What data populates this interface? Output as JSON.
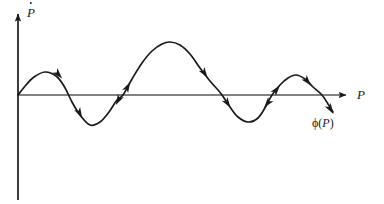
{
  "figure": {
    "name": "phase-portrait-pdot-vs-p",
    "background_color": "#ffffff",
    "stroke_color": "#1a1a1a"
  },
  "axes": {
    "y_axis": {
      "label": "P",
      "label_accent": "dot",
      "label_full": "Ṗ",
      "name": "y-axis",
      "origin_x": 18,
      "top_y": 12,
      "bottom_y": 200,
      "arrow": "up"
    },
    "x_axis": {
      "label": "P",
      "name": "x-axis",
      "origin_y": 95,
      "left_x": 18,
      "right_x": 350,
      "arrow": "right"
    }
  },
  "annotations": {
    "curve_label": "ϕ(P)",
    "curve_label_phi": "ϕ",
    "curve_label_paren_open": "(",
    "curve_label_var": "P",
    "curve_label_paren_close": ")"
  },
  "chart_data": {
    "type": "line",
    "title": "",
    "xlabel": "P",
    "ylabel": "P-dot",
    "legend": [],
    "grid": false,
    "axis_origin": [
      18,
      95
    ],
    "xlim": [
      18,
      350
    ],
    "ylim": [
      200,
      12
    ],
    "series": [
      {
        "name": "phi(P)",
        "description": "Oscillating curve through origin: small peak, trough, large peak, deep trough, medium peak, descending past axis",
        "points": [
          [
            18,
            95
          ],
          [
            26,
            85
          ],
          [
            34,
            77
          ],
          [
            45,
            72
          ],
          [
            56,
            76
          ],
          [
            64,
            86
          ],
          [
            72,
            102
          ],
          [
            80,
            115
          ],
          [
            90,
            125
          ],
          [
            100,
            122
          ],
          [
            109,
            112
          ],
          [
            117,
            100
          ],
          [
            123,
            95
          ],
          [
            132,
            79
          ],
          [
            142,
            63
          ],
          [
            152,
            51
          ],
          [
            162,
            44
          ],
          [
            170,
            42
          ],
          [
            180,
            45
          ],
          [
            190,
            54
          ],
          [
            200,
            68
          ],
          [
            210,
            81
          ],
          [
            218,
            90
          ],
          [
            222,
            95
          ],
          [
            230,
            107
          ],
          [
            238,
            117
          ],
          [
            248,
            122
          ],
          [
            258,
            118
          ],
          [
            266,
            106
          ],
          [
            272,
            95
          ],
          [
            280,
            85
          ],
          [
            288,
            78
          ],
          [
            296,
            75
          ],
          [
            305,
            79
          ],
          [
            313,
            87
          ],
          [
            322,
            95
          ],
          [
            328,
            104
          ],
          [
            333,
            112
          ]
        ],
        "extrema": [
          {
            "kind": "peak",
            "x": 45,
            "y": 72
          },
          {
            "kind": "trough",
            "x": 90,
            "y": 125
          },
          {
            "kind": "peak",
            "x": 169,
            "y": 42
          },
          {
            "kind": "trough",
            "x": 248,
            "y": 122
          },
          {
            "kind": "peak",
            "x": 296,
            "y": 75
          }
        ],
        "zero_crossings": [
          18,
          68,
          123,
          222,
          272,
          322
        ],
        "flow_arrows": [
          {
            "x": 59,
            "y": 75,
            "angle": 48,
            "name": "flow-arrow-1"
          },
          {
            "x": 80,
            "y": 114,
            "angle": 62,
            "name": "flow-arrow-2"
          },
          {
            "x": 128,
            "y": 86,
            "angle": -62,
            "name": "flow-arrow-3"
          },
          {
            "x": 118,
            "y": 101,
            "angle": 118,
            "name": "flow-arrow-4"
          },
          {
            "x": 205,
            "y": 74,
            "angle": 56,
            "name": "flow-arrow-5"
          },
          {
            "x": 228,
            "y": 104,
            "angle": 57,
            "name": "flow-arrow-6"
          },
          {
            "x": 277,
            "y": 89,
            "angle": -52,
            "name": "flow-arrow-7"
          },
          {
            "x": 267,
            "y": 104,
            "angle": 128,
            "name": "flow-arrow-8"
          },
          {
            "x": 308,
            "y": 82,
            "angle": 50,
            "name": "flow-arrow-9"
          },
          {
            "x": 331,
            "y": 110,
            "angle": 58,
            "name": "flow-arrow-10"
          }
        ]
      }
    ]
  }
}
